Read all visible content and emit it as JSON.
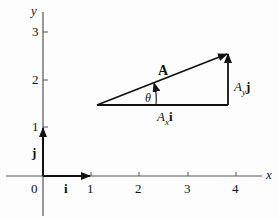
{
  "axes": {
    "x_label": "x",
    "y_label": "y",
    "origin_label": "0",
    "x_ticks": [
      "1",
      "2",
      "3",
      "4"
    ],
    "y_ticks": [
      "1",
      "2",
      "3"
    ]
  },
  "unit_vectors": {
    "i": "i",
    "j": "j"
  },
  "vector": {
    "name": "A",
    "angle": "θ",
    "x_component": {
      "sym": "A",
      "sub": "x",
      "unit": "i"
    },
    "y_component": {
      "sym": "A",
      "sub": "y",
      "unit": "j"
    }
  },
  "colors": {
    "ink": "#111111",
    "axis": "#555555"
  }
}
